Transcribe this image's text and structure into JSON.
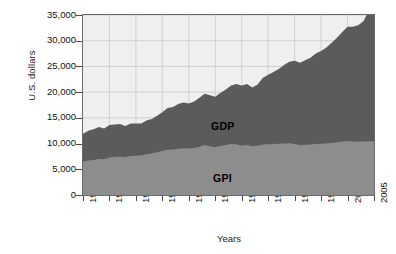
{
  "chart_data": {
    "type": "area",
    "title": "",
    "xlabel": "Years",
    "ylabel": "U.S. dollars",
    "xlim": [
      1950,
      2005
    ],
    "ylim": [
      0,
      35000
    ],
    "grid": true,
    "stacked": true,
    "legend_position": "inline-annotation",
    "xticks": [
      "1950",
      "1955",
      "1960",
      "1965",
      "1970",
      "1975",
      "1980",
      "1985",
      "1990",
      "1995",
      "2000",
      "2005"
    ],
    "yticks": [
      "0",
      "5,000",
      "10,000",
      "15,000",
      "20,000",
      "25,000",
      "30,000",
      "35,000"
    ],
    "ytick_values": [
      0,
      5000,
      10000,
      15000,
      20000,
      25000,
      30000,
      35000
    ],
    "x": [
      1950,
      1951,
      1952,
      1953,
      1954,
      1955,
      1956,
      1957,
      1958,
      1959,
      1960,
      1961,
      1962,
      1963,
      1964,
      1965,
      1966,
      1967,
      1968,
      1969,
      1970,
      1971,
      1972,
      1973,
      1974,
      1975,
      1976,
      1977,
      1978,
      1979,
      1980,
      1981,
      1982,
      1983,
      1984,
      1985,
      1986,
      1987,
      1988,
      1989,
      1990,
      1991,
      1992,
      1993,
      1994,
      1995,
      1996,
      1997,
      1998,
      1999,
      2000,
      2001,
      2002,
      2003,
      2004
    ],
    "series": [
      {
        "name": "GPI",
        "color": "#8d8d8d",
        "label": "GPI",
        "values": [
          6500,
          6700,
          6800,
          7000,
          6950,
          7300,
          7400,
          7450,
          7350,
          7600,
          7650,
          7700,
          7900,
          8050,
          8300,
          8600,
          8800,
          8850,
          9000,
          9100,
          9050,
          9150,
          9400,
          9700,
          9500,
          9300,
          9550,
          9700,
          9900,
          9850,
          9600,
          9700,
          9500,
          9600,
          9800,
          9850,
          9900,
          9950,
          10000,
          10050,
          9900,
          9700,
          9750,
          9800,
          9900,
          9950,
          10000,
          10100,
          10250,
          10400,
          10500,
          10400,
          10350,
          10400,
          10450
        ]
      },
      {
        "name": "GDP",
        "color": "#5b5b5b",
        "label": "GDP",
        "values": [
          11900,
          12500,
          12800,
          13200,
          12950,
          13600,
          13700,
          13800,
          13400,
          13900,
          13900,
          13900,
          14500,
          14800,
          15400,
          16100,
          16900,
          17100,
          17700,
          18000,
          17800,
          18200,
          18900,
          19700,
          19400,
          19100,
          19900,
          20500,
          21300,
          21600,
          21300,
          21600,
          20900,
          21500,
          22800,
          23400,
          23900,
          24500,
          25300,
          25900,
          26100,
          25700,
          26200,
          26700,
          27500,
          28000,
          28700,
          29600,
          30600,
          31700,
          32700,
          32700,
          33000,
          33800,
          35800
        ]
      }
    ],
    "note": "Stacked area: GPI is lower band (medium gray), GDP is upper band (dark gray); GDP values shown are cumulative totals."
  },
  "axes": {
    "ylabel": "U.S. dollars",
    "xlabel": "Years"
  }
}
